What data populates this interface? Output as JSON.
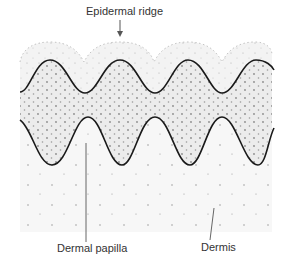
{
  "diagram": {
    "title_label": "Epidermal ridge",
    "labels": {
      "epidermal_ridge": "Epidermal ridge",
      "dermal_papilla": "Dermal papilla",
      "dermis": "Dermis"
    },
    "colors": {
      "background": "#ffffff",
      "epidermis_fill": "#ececec",
      "outer_layer_fill": "#f3f3f3",
      "dermis_fill": "#f7f7f7",
      "outline": "#1a1a1a",
      "dots": "#8a8a8a",
      "leader_line": "#555555",
      "text": "#333333"
    }
  }
}
